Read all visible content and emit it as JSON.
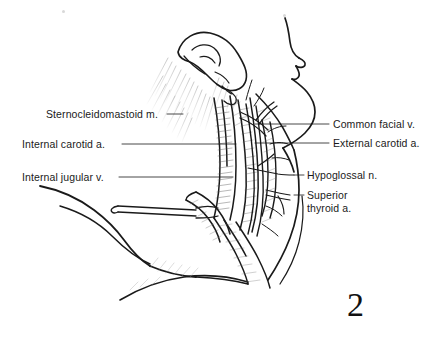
{
  "figure": {
    "number": "2",
    "caption_type": "anatomical-line-drawing",
    "view": "right lateral profile",
    "background_color": "#ffffff",
    "ink_color": "#1a1a1a"
  },
  "labels_left": [
    {
      "id": "sternocleidomastoid",
      "text": "Sternocleidomastoid m.",
      "x": 46,
      "y": 108,
      "leader": {
        "type": "dash",
        "x1": 167,
        "y1": 114,
        "x2": 183,
        "y2": 114
      }
    },
    {
      "id": "internal-carotid",
      "text": "Internal carotid a.",
      "x": 22,
      "y": 138,
      "leader": {
        "type": "line",
        "x1": 122,
        "y1": 144,
        "x2": 236,
        "y2": 144
      }
    },
    {
      "id": "internal-jugular",
      "text": "Internal jugular v.",
      "x": 22,
      "y": 171,
      "leader": {
        "type": "line",
        "x1": 119,
        "y1": 177,
        "x2": 233,
        "y2": 177
      }
    }
  ],
  "labels_right": [
    {
      "id": "common-facial-vein",
      "text": "Common facial v.",
      "x": 333,
      "y": 118,
      "leader": {
        "type": "line",
        "x1": 255,
        "y1": 124,
        "x2": 329,
        "y2": 124
      }
    },
    {
      "id": "external-carotid",
      "text": "External carotid a.",
      "x": 333,
      "y": 137,
      "leader": {
        "type": "line",
        "x1": 255,
        "y1": 143,
        "x2": 329,
        "y2": 143
      }
    },
    {
      "id": "hypoglossal-nerve",
      "text": "Hypoglossal n.",
      "x": 307,
      "y": 169,
      "leader": {
        "type": "line",
        "x1": 294,
        "y1": 175,
        "x2": 304,
        "y2": 175
      }
    },
    {
      "id": "superior-thyroid",
      "text": "Superior\nthyroid a.",
      "x": 307,
      "y": 189,
      "leader": {
        "type": "line",
        "x1": 294,
        "y1": 195,
        "x2": 304,
        "y2": 195
      }
    }
  ],
  "structures": [
    {
      "id": "auricle",
      "name": "ear auricle"
    },
    {
      "id": "facial-profile",
      "name": "facial profile (forehead, nose, lips, chin)"
    },
    {
      "id": "mandible-border",
      "name": "mandibular border"
    },
    {
      "id": "neck-contour",
      "name": "anterior neck contour"
    },
    {
      "id": "shoulder-contour",
      "name": "shoulder and clavicle contour"
    },
    {
      "id": "dissection-field",
      "name": "carotid sheath dissection field"
    },
    {
      "id": "retractor",
      "name": "surgical retractor"
    },
    {
      "id": "hair-stipple",
      "name": "hairline stippling"
    }
  ],
  "specks": [
    {
      "x": 62,
      "y": 10,
      "size": 3
    },
    {
      "x": 283,
      "y": 14,
      "size": 3
    }
  ]
}
